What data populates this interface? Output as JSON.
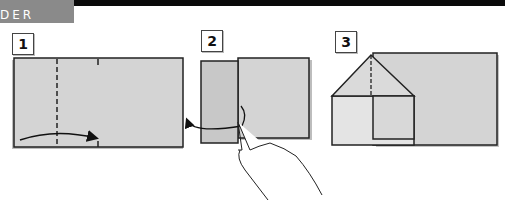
{
  "header": {
    "section_label": "DER",
    "tab_color": "#8a8a8a",
    "bar_color": "#0a0a0a"
  },
  "steps": [
    {
      "number": "1",
      "description": "Fold left side along dashed line toward center",
      "paper_color": "#d4d4d4",
      "icon": "curved-arrow-icon"
    },
    {
      "number": "2",
      "description": "Unfold the flap back out",
      "paper_color": "#d4d4d4",
      "icon": "hand-icon"
    },
    {
      "number": "3",
      "description": "Fold top corners down to form a roof/house shape",
      "paper_color": "#d4d4d4",
      "icon": "house-fold-icon"
    }
  ]
}
